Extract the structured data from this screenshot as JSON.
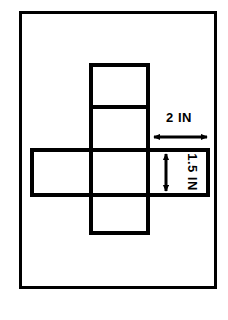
{
  "figure": {
    "background_color": "#ffffff",
    "ink_color": "#000000"
  },
  "border": {
    "name": "outer-frame",
    "x": 19,
    "y": 11,
    "width": 197,
    "height": 277,
    "stroke_width": 3,
    "color": "#000000"
  },
  "net": {
    "shape": "cube-net-cross",
    "stroke_width": 4,
    "color": "#000000",
    "cell_width": 60,
    "cell_height": 44,
    "column_x": [
      30,
      89,
      150,
      210
    ],
    "row_y": [
      63,
      107,
      150,
      195,
      235
    ],
    "cells": [
      {
        "name": "net-cell-top",
        "x": 89,
        "y": 63,
        "width": 61,
        "height": 44
      },
      {
        "name": "net-cell-upper-middle",
        "x": 89,
        "y": 107,
        "width": 61,
        "height": 43
      },
      {
        "name": "net-cell-left",
        "x": 30,
        "y": 150,
        "width": 59,
        "height": 45
      },
      {
        "name": "net-cell-center",
        "x": 89,
        "y": 150,
        "width": 61,
        "height": 45
      },
      {
        "name": "net-cell-right",
        "x": 150,
        "y": 150,
        "width": 60,
        "height": 45
      },
      {
        "name": "net-cell-bottom",
        "x": 89,
        "y": 195,
        "width": 61,
        "height": 40
      }
    ]
  },
  "dimensions": {
    "width_label": {
      "name": "width-dimension",
      "text": "2 IN",
      "text_x": 179,
      "text_y": 122,
      "orientation": "horizontal",
      "arrow": {
        "x1": 152,
        "y1": 137,
        "x2": 209,
        "y2": 137
      }
    },
    "height_label": {
      "name": "height-dimension",
      "text": "1.5 IN",
      "text_x": 188,
      "text_y": 172,
      "orientation": "vertical-rotated-90",
      "arrow": {
        "x1": 166,
        "y1": 152,
        "x2": 166,
        "y2": 193
      }
    }
  }
}
